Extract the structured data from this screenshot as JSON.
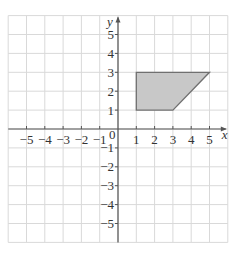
{
  "chart_data": {
    "type": "area",
    "title": "",
    "xlabel": "x",
    "ylabel": "y",
    "xlim": [
      -6,
      6
    ],
    "ylim": [
      -6,
      6
    ],
    "grid": true,
    "x_ticks": [
      -5,
      -4,
      -3,
      -2,
      -1,
      1,
      2,
      3,
      4,
      5
    ],
    "y_ticks": [
      5,
      4,
      3,
      2,
      1,
      -1,
      -2,
      -3,
      -4,
      -5
    ],
    "origin_label": "0",
    "series": [
      {
        "name": "shaded quadrilateral",
        "shape": "polygon",
        "vertices": [
          [
            1,
            1
          ],
          [
            1,
            3
          ],
          [
            5,
            3
          ],
          [
            3,
            1
          ]
        ],
        "fill": "#c8c8c8",
        "stroke": "#707070"
      }
    ]
  },
  "labels": {
    "x_axis": "x",
    "y_axis": "y",
    "origin": "0",
    "x_ticks": [
      "−5",
      "−4",
      "−3",
      "−2",
      "−1",
      "1",
      "2",
      "3",
      "4",
      "5"
    ],
    "y_ticks": [
      "5",
      "4",
      "3",
      "2",
      "1",
      "−1",
      "−2",
      "−3",
      "−4",
      "−5"
    ]
  },
  "colors": {
    "grid": "#d9d9d9",
    "axis": "#555555",
    "shape_fill": "#c8c8c8",
    "shape_stroke": "#707070"
  }
}
